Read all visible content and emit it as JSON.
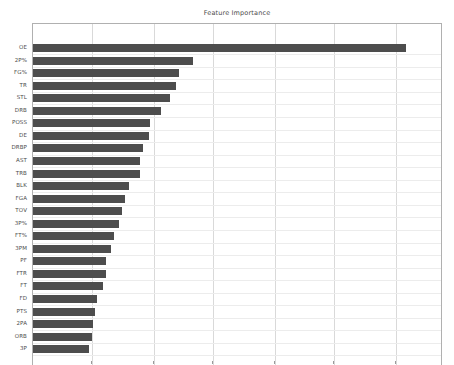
{
  "chart_data": {
    "type": "bar",
    "orientation": "horizontal",
    "title": "Feature Importance",
    "xlabel": "",
    "ylabel": "",
    "grid": true,
    "legend": null,
    "bar_color": "#4d4d4d",
    "xlim": [
      0,
      0.105
    ],
    "x_gridline_values": [
      0.015,
      0.031,
      0.046,
      0.062,
      0.077,
      0.093
    ],
    "categories": [
      "OE",
      "2P%",
      "FG%",
      "TR",
      "STL",
      "DRB",
      "POSS",
      "DE",
      "DRBP",
      "AST",
      "TRB",
      "BLK",
      "FGA",
      "TOV",
      "3P%",
      "FT%",
      "3PM",
      "PF",
      "FTR",
      "FT",
      "FD",
      "PTS",
      "2PA",
      "ORB",
      "3P"
    ],
    "values": [
      0.0955,
      0.041,
      0.0375,
      0.0365,
      0.0351,
      0.0327,
      0.03,
      0.0298,
      0.0281,
      0.0273,
      0.0273,
      0.0245,
      0.0235,
      0.0229,
      0.0221,
      0.0207,
      0.0199,
      0.0187,
      0.0186,
      0.018,
      0.0163,
      0.016,
      0.0153,
      0.015,
      0.0144
    ],
    "x_tick_labels_visible": false,
    "note": "bottom axis tick labels are cropped out of the figure"
  },
  "figure": {
    "title": "Feature Importance",
    "background": "#ffffff",
    "axes_border_color": "#b0b0b0",
    "gridline_color": "#d9d9d9"
  }
}
